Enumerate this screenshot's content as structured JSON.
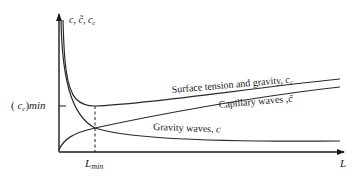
{
  "diagram": {
    "axes": {
      "y_label": "c, c̃, c_c",
      "y_label_parts": {
        "c": "c",
        "sep1": ", ",
        "ctilde": "c̃",
        "sep2": ", ",
        "cc": "c",
        "cc_sub": "c"
      },
      "x_label": "L"
    },
    "annotations": {
      "min_value_label": {
        "open": "( ",
        "c": "c",
        "sub": "c",
        "close": ")",
        "min": "min"
      },
      "lmin_label": {
        "L": "L",
        "sub": "min"
      }
    },
    "curves": [
      {
        "name": "Surface tension and gravity",
        "label_text": "Surface tension and gravity, ",
        "symbol": "c",
        "symbol_sub": "c"
      },
      {
        "name": "Capillary waves",
        "label_text": "Capillary waves ,",
        "symbol": "c̃"
      },
      {
        "name": "Gravity waves",
        "label_text": "Gravity waves, ",
        "symbol": "c"
      }
    ]
  }
}
